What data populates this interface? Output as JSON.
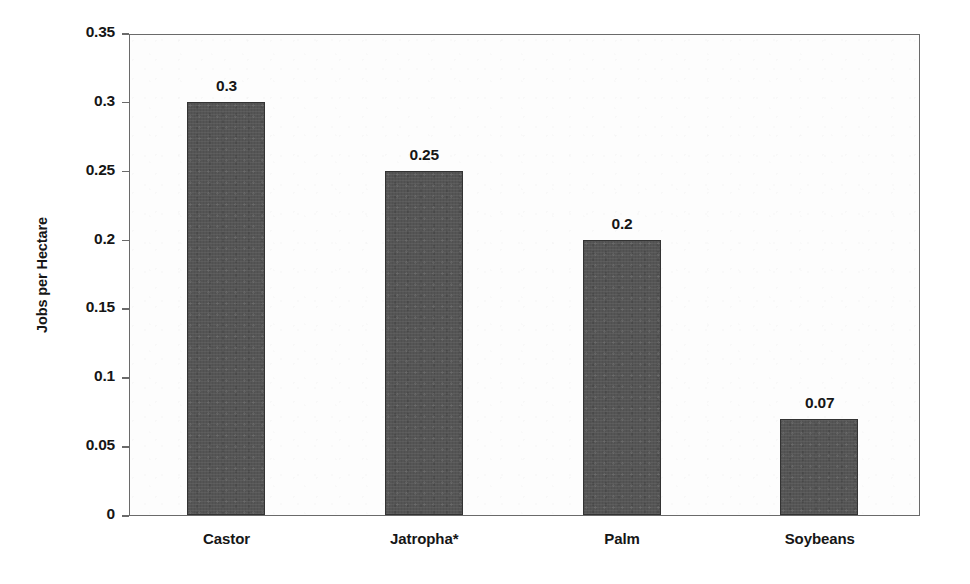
{
  "chart_data": {
    "type": "bar",
    "title": "",
    "xlabel": "",
    "ylabel": "Jobs per Hectare",
    "categories": [
      "Castor",
      "Jatropha*",
      "Palm",
      "Soybeans"
    ],
    "values": [
      0.3,
      0.25,
      0.2,
      0.07
    ],
    "value_labels": [
      "0.3",
      "0.25",
      "0.2",
      "0.07"
    ],
    "ylim": [
      0,
      0.35
    ],
    "ytick_values": [
      0,
      0.05,
      0.1,
      0.15,
      0.2,
      0.25,
      0.3,
      0.35
    ],
    "ytick_labels": [
      "0",
      "0.05",
      "0.1",
      "0.15",
      "0.2",
      "0.25",
      "0.3",
      "0.35"
    ],
    "grid": false,
    "legend": null,
    "series": [
      {
        "name": "Jobs per Hectare",
        "values": [
          0.3,
          0.25,
          0.2,
          0.07
        ],
        "color": "#555555"
      }
    ],
    "colors": {
      "bar_fill": "#555555",
      "bar_border": "#333333",
      "axis": "#6a6a6a",
      "text": "#161616",
      "plot_background": "#fdfdfd",
      "page_background": "#ffffff"
    }
  }
}
